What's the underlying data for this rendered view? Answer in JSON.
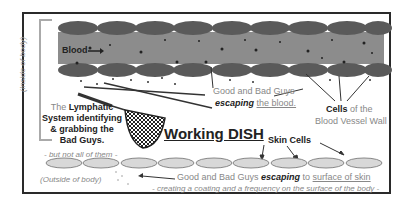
{
  "diagram": {
    "title": "Working DISH",
    "labels": {
      "blood": "Blood",
      "inside_body": "(Inside of body)",
      "outside_body": "(Outside of body)",
      "good_bad_guys": "Good and Bad Guys",
      "escaping_word": "escaping",
      "the_blood": "the blood.",
      "cells_bold": "Cells",
      "cells_rest": " of the",
      "blood_vessel_wall": "Blood Vessel Wall",
      "lymph_the": "The ",
      "lymph_bold1": "Lymphatic",
      "lymph_bold2": "System identifying",
      "lymph_bold3": "& grabbing the",
      "lymph_bold4": "Bad Guys.",
      "but_not_all": "- but not all of them -",
      "skin_cells": "Skin Cells",
      "surface_prefix": "Good and Bad Guys ",
      "surface_escaping": "escaping",
      "surface_to": " to ",
      "surface_skin": "surface of skin",
      "coating": "- creating a coating and a frequency on the surface of the body -"
    },
    "colors": {
      "vessel": "#8c8c8c",
      "vessel_cells": "#5a5a5a",
      "skin_cells": "#d8d8d8",
      "frame": "#2a2a2a"
    }
  }
}
